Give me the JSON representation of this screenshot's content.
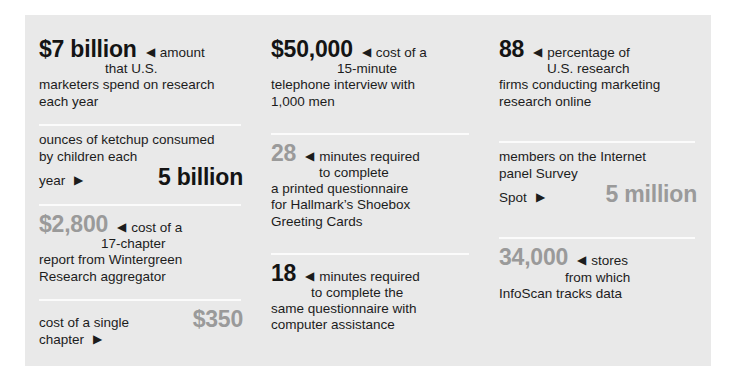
{
  "page": {
    "background": "#ffffff",
    "panel_background": "#e9e9e9",
    "rule_color": "#fbfbfb",
    "dark_text": "#1c1c1c",
    "gray_text": "#9a9a9a",
    "arrow_left_glyph": "◀",
    "arrow_right_glyph": "▶"
  },
  "columns": [
    {
      "name": "left-column",
      "cells": [
        {
          "name": "cell-7-billion",
          "value": "$7 billion",
          "value_color": "dark",
          "arrow": "left",
          "caption_line1": "amount",
          "caption_line2": "that U.S.",
          "tail_line1": "marketers spend on research",
          "tail_line2": "each year"
        },
        {
          "name": "cell-5-billion-ketchup",
          "value": "5 billion",
          "value_color": "dark",
          "arrow": "right",
          "lead_line1": "ounces of ketchup consumed",
          "lead_line2": "by children each",
          "lead_line3": "year"
        },
        {
          "name": "cell-2800-report",
          "value": "$2,800",
          "value_color": "gray",
          "arrow": "left",
          "caption_line1": "cost of a",
          "caption_line2": "17-chapter",
          "tail_line1": "report from Wintergreen",
          "tail_line2": "Research aggregator"
        },
        {
          "name": "cell-350-chapter",
          "value": "$350",
          "value_color": "gray",
          "arrow": "right",
          "lead_line1": "cost of a single",
          "lead_line2": "chapter"
        }
      ]
    },
    {
      "name": "middle-column",
      "cells": [
        {
          "name": "cell-50000-telephone",
          "value": "$50,000",
          "value_color": "dark",
          "arrow": "left",
          "caption_line1": "cost of a",
          "caption_line2": "15-minute",
          "tail_line1": "telephone interview with",
          "tail_line2": "1,000 men"
        },
        {
          "name": "cell-28-minutes",
          "value": "28",
          "value_color": "gray",
          "arrow": "left",
          "caption_line1": "minutes required",
          "caption_line2": "to complete",
          "tail_line1": "a printed questionnaire",
          "tail_line2": "for Hallmark’s Shoebox",
          "tail_line3": "Greeting Cards"
        },
        {
          "name": "cell-18-minutes",
          "value": "18",
          "value_color": "dark",
          "arrow": "left",
          "caption_line1": "minutes required",
          "caption_line2": "to complete the",
          "tail_line1": "same questionnaire with",
          "tail_line2": "computer assistance"
        }
      ]
    },
    {
      "name": "right-column",
      "cells": [
        {
          "name": "cell-88-percentage",
          "value": "88",
          "value_color": "dark",
          "arrow": "left",
          "caption_line1": "percentage of",
          "caption_line2": "U.S. research",
          "tail_line1": "firms conducting marketing",
          "tail_line2": "research online"
        },
        {
          "name": "cell-5-million-surveyspot",
          "value": "5 million",
          "value_color": "gray",
          "arrow": "right",
          "lead_line1": "members on the Internet",
          "lead_line2": "panel Survey",
          "lead_line3": "Spot"
        },
        {
          "name": "cell-34000-infoscan",
          "value": "34,000",
          "value_color": "gray",
          "arrow": "left",
          "caption_line1": "stores",
          "caption_line2": "from which",
          "tail_line1": "InfoScan tracks data"
        }
      ]
    }
  ]
}
